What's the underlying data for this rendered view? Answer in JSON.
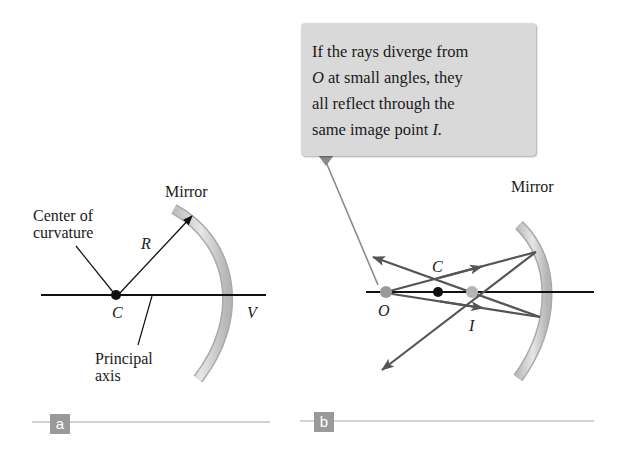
{
  "panel_a": {
    "tag": "a",
    "mirror_label": "Mirror",
    "center_label_line1": "Center of",
    "center_label_line2": "curvature",
    "radius_label": "R",
    "center_point_label": "C",
    "vertex_label": "V",
    "axis_label_line1": "Principal",
    "axis_label_line2": "axis"
  },
  "panel_b": {
    "tag": "b",
    "mirror_label": "Mirror",
    "callout_lines": [
      "If the rays diverge from",
      "at small angles, they",
      "all reflect through the",
      "same image point"
    ],
    "callout_O": "O",
    "callout_I": "I.",
    "center_point_label": "C",
    "object_label": "O",
    "image_label": "I"
  },
  "colors": {
    "mirror_fill": "#cfcfcf",
    "ray": "#555555",
    "axis": "#111111",
    "callout_bg": "#d9d9d9",
    "tag_bg": "#9a9a9a",
    "point_gray": "#9a9a9a"
  }
}
